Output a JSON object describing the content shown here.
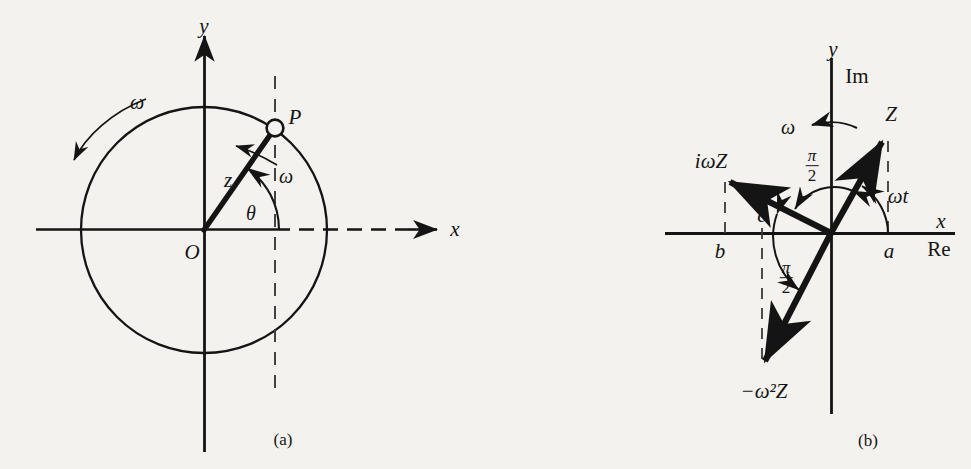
{
  "figure": {
    "background_color": "#f4f2ee",
    "ink_color": "#141414",
    "width": 971,
    "height": 469
  },
  "panels": [
    {
      "caption": "(a)",
      "title": "Uniform circular motion of point P in the complex plane",
      "axes": {
        "x_label": "x",
        "y_label": "y",
        "origin_label": "O"
      },
      "circle": {
        "center": [
          204,
          230
        ],
        "radius": 123
      },
      "point": {
        "label": "P",
        "position": [
          275,
          128
        ],
        "angle_deg": 55
      },
      "vector": {
        "label": "z",
        "from": "O",
        "to": "P"
      },
      "angle_label": "θ",
      "omega_labels": [
        "ω",
        "ω"
      ],
      "dashed_lines": [
        "vertical-through-P",
        "horizontal-from-P-foot-to-right"
      ]
    },
    {
      "caption": "(b)",
      "title": "Phasor Z and its time derivatives in the complex plane",
      "axes": {
        "x_label": "x",
        "x_label_alt": "Re",
        "y_label": "y",
        "y_label_alt": "Im"
      },
      "origin": [
        831,
        233
      ],
      "rotation_label": "ω",
      "vectors": [
        {
          "name": "Z",
          "label": "Z",
          "tip": [
            883,
            137
          ],
          "label_pos": [
            891,
            114
          ]
        },
        {
          "name": "i-omega-Z",
          "label": "iωZ",
          "tip": [
            728,
            180
          ],
          "label_pos": [
            713,
            160
          ]
        },
        {
          "name": "minus-omega-squared-Z",
          "label": "−ω²Z",
          "tip": [
            762,
            365
          ],
          "label_pos": [
            763,
            391
          ]
        }
      ],
      "angle_labels": [
        {
          "name": "omega-t",
          "label": "ωt",
          "pos": [
            896,
            196
          ]
        },
        {
          "name": "pi-over-2-upper",
          "numerator": "π",
          "denominator": "2",
          "pos": [
            812,
            166
          ]
        },
        {
          "name": "pi-over-2-lower",
          "numerator": "π",
          "denominator": "2",
          "pos": [
            786,
            277
          ]
        }
      ],
      "axis_tick_labels": [
        {
          "name": "a",
          "label": "a",
          "pos": [
            888,
            250
          ]
        },
        {
          "name": "b",
          "label": "b",
          "pos": [
            720,
            250
          ]
        },
        {
          "name": "c",
          "label": "c",
          "pos": [
            762,
            219
          ]
        }
      ],
      "dashed_lines": [
        "vertical-from-Z-tip-to-a",
        "vertical-from-iwZ-tip-to-b",
        "vertical-from-origin-to-minus-omega2Z-tip-at-c"
      ]
    }
  ]
}
